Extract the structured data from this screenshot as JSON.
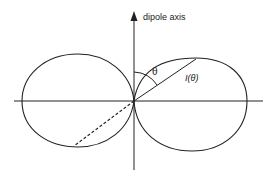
{
  "diagram": {
    "axis_label": "dipole axis",
    "angle_label": "θ",
    "radius_label": "I(θ)",
    "colors": {
      "stroke": "#222222",
      "background": "#ffffff"
    }
  }
}
